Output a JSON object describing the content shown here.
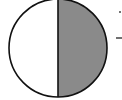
{
  "diagram": {
    "type": "circle-half-shaded",
    "circle": {
      "cx": 58,
      "cy": 48,
      "r": 50
    },
    "shaded_half": "right",
    "colors": {
      "fill_shaded": "#8a8a8a",
      "fill_unshaded": "#ffffff",
      "stroke": "#111111"
    },
    "edge_marks": [
      {
        "kind": "dot",
        "x": 119,
        "y": 12
      },
      {
        "kind": "dash",
        "x1": 116,
        "y1": 38,
        "x2": 122,
        "y2": 38
      }
    ]
  }
}
